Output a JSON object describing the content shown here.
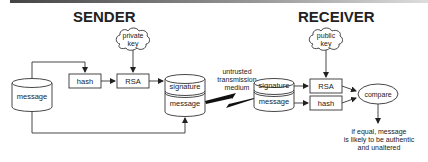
{
  "titles": {
    "sender": "SENDER",
    "receiver": "RECEIVER"
  },
  "sender": {
    "message": "message",
    "hash": "hash",
    "rsa": "RSA",
    "key_line1": "private",
    "key_line2": "key",
    "signature": "signature",
    "signed_message": "message"
  },
  "channel": {
    "line1": "untrusted",
    "line2": "transmission",
    "line3": "medium"
  },
  "receiver": {
    "signature": "signature",
    "message": "message",
    "rsa": "RSA",
    "hash": "hash",
    "key_line1": "public",
    "key_line2": "key",
    "compare": "compare",
    "result_line1": "if equal, message",
    "result_line2": "is likely to be authentic",
    "result_line3": "and unaltered"
  }
}
